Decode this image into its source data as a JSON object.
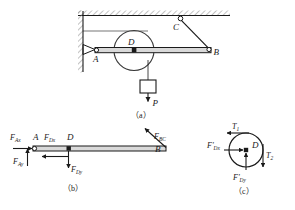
{
  "figure": {
    "colors": {
      "stroke": "#1a1a1a",
      "hatch": "#8a8a8a",
      "beam_fill": "#d9d9d9",
      "background": "#ffffff"
    }
  },
  "panel_a": {
    "caption": "（a）",
    "points": {
      "A": "A",
      "B": "B",
      "C": "C",
      "D": "D"
    },
    "load_label": "P",
    "elements": {
      "wall": "hatched-wall",
      "ceiling": "hatched-ceiling",
      "pin_support": "pin-support-A",
      "beam": "beam-AB",
      "pulley": "pulley-D",
      "cable": "cable-CB",
      "block": "hanging-block"
    }
  },
  "panel_b": {
    "caption": "（b）",
    "points": {
      "A": "A",
      "B": "B",
      "D": "D"
    },
    "forces": [
      {
        "name": "F_Ax",
        "base": "F",
        "sub": "Ax",
        "direction": "right"
      },
      {
        "name": "F_Ay",
        "base": "F",
        "sub": "Ay",
        "direction": "up"
      },
      {
        "name": "F_Dx",
        "base": "F",
        "sub": "Dx",
        "direction": "left"
      },
      {
        "name": "F_Dy",
        "base": "F",
        "sub": "Dy",
        "direction": "down"
      },
      {
        "name": "F_BC",
        "base": "F",
        "sub": "BC",
        "direction": "up-left"
      }
    ]
  },
  "panel_c": {
    "caption": "（c）",
    "points": {
      "D": "D"
    },
    "forces": [
      {
        "name": "T1",
        "base": "T",
        "sub": "1",
        "direction": "left"
      },
      {
        "name": "T2",
        "base": "T",
        "sub": "2",
        "direction": "down"
      },
      {
        "name": "F'_Dx",
        "base": "F'",
        "sub": "Dx",
        "direction": "right"
      },
      {
        "name": "F'_Dy",
        "base": "F'",
        "sub": "Dy",
        "direction": "up"
      }
    ]
  }
}
